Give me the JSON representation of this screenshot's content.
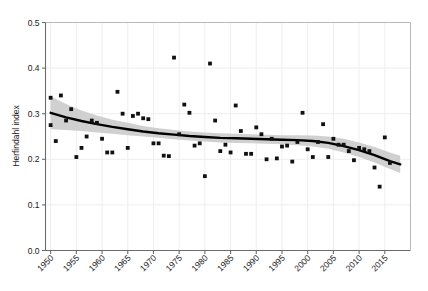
{
  "chart_data": {
    "type": "scatter",
    "title": "",
    "xlabel": "",
    "ylabel": "Herfindahl index",
    "xlim": [
      1949,
      2020
    ],
    "ylim": [
      0.0,
      0.5
    ],
    "grid": true,
    "legend": "none",
    "yticks": [
      "0.0",
      "0.1",
      "0.2",
      "0.3",
      "0.4",
      "0.5"
    ],
    "ytick_values": [
      0.0,
      0.1,
      0.2,
      0.3,
      0.4,
      0.5
    ],
    "xticks": [
      "1950",
      "1955",
      "1960",
      "1965",
      "1970",
      "1975",
      "1980",
      "1985",
      "1990",
      "1995",
      "2000",
      "2005",
      "2010",
      "2015"
    ],
    "xtick_values": [
      1950,
      1955,
      1960,
      1965,
      1970,
      1975,
      1980,
      1985,
      1990,
      1995,
      2000,
      2005,
      2010,
      2015
    ],
    "series": [
      {
        "name": "Herfindahl index observations",
        "type": "scatter",
        "marker": "square",
        "color": "#111111",
        "x": [
          1950,
          1950,
          1951,
          1952,
          1953,
          1954,
          1955,
          1956,
          1957,
          1958,
          1959,
          1960,
          1961,
          1962,
          1963,
          1964,
          1965,
          1966,
          1967,
          1968,
          1969,
          1970,
          1971,
          1972,
          1973,
          1974,
          1975,
          1976,
          1977,
          1978,
          1979,
          1980,
          1981,
          1982,
          1983,
          1984,
          1985,
          1986,
          1987,
          1988,
          1989,
          1990,
          1991,
          1992,
          1993,
          1994,
          1995,
          1996,
          1997,
          1998,
          1999,
          2000,
          2001,
          2002,
          2003,
          2004,
          2005,
          2006,
          2007,
          2008,
          2009,
          2010,
          2011,
          2012,
          2013,
          2014,
          2015,
          2016
        ],
        "y": [
          0.335,
          0.275,
          0.24,
          0.34,
          0.285,
          0.31,
          0.205,
          0.225,
          0.25,
          0.285,
          0.28,
          0.245,
          0.215,
          0.215,
          0.348,
          0.3,
          0.225,
          0.295,
          0.3,
          0.29,
          0.288,
          0.235,
          0.235,
          0.208,
          0.207,
          0.423,
          0.255,
          0.32,
          0.302,
          0.23,
          0.235,
          0.163,
          0.41,
          0.285,
          0.218,
          0.232,
          0.215,
          0.318,
          0.262,
          0.212,
          0.212,
          0.27,
          0.255,
          0.2,
          0.245,
          0.202,
          0.228,
          0.23,
          0.195,
          0.238,
          0.302,
          0.222,
          0.205,
          0.238,
          0.277,
          0.205,
          0.245,
          0.232,
          0.232,
          0.218,
          0.198,
          0.225,
          0.222,
          0.218,
          0.182,
          0.14,
          0.248,
          0.192
        ]
      },
      {
        "name": "LOESS smoothed trend",
        "type": "line",
        "color": "#000000",
        "x": [
          1950,
          1953,
          1956,
          1959,
          1962,
          1965,
          1968,
          1971,
          1974,
          1977,
          1980,
          1983,
          1986,
          1989,
          1992,
          1995,
          1998,
          2001,
          2004,
          2007,
          2010,
          2013,
          2016,
          2018
        ],
        "y": [
          0.302,
          0.292,
          0.284,
          0.277,
          0.271,
          0.266,
          0.261,
          0.257,
          0.254,
          0.251,
          0.249,
          0.247,
          0.246,
          0.245,
          0.244,
          0.243,
          0.242,
          0.24,
          0.236,
          0.229,
          0.22,
          0.209,
          0.196,
          0.189
        ]
      },
      {
        "name": "confidence band",
        "type": "band",
        "color": "#c8c8c8",
        "x": [
          1950,
          1953,
          1956,
          1959,
          1962,
          1965,
          1968,
          1971,
          1974,
          1977,
          1980,
          1983,
          1986,
          1989,
          1992,
          1995,
          1998,
          2001,
          2004,
          2007,
          2010,
          2013,
          2016,
          2018
        ],
        "lower": [
          0.266,
          0.264,
          0.262,
          0.259,
          0.256,
          0.253,
          0.25,
          0.247,
          0.244,
          0.241,
          0.239,
          0.237,
          0.236,
          0.235,
          0.234,
          0.233,
          0.231,
          0.228,
          0.223,
          0.215,
          0.205,
          0.193,
          0.179,
          0.17
        ],
        "upper": [
          0.338,
          0.321,
          0.307,
          0.296,
          0.287,
          0.28,
          0.273,
          0.268,
          0.264,
          0.261,
          0.259,
          0.257,
          0.256,
          0.255,
          0.254,
          0.253,
          0.253,
          0.252,
          0.25,
          0.245,
          0.237,
          0.227,
          0.215,
          0.208
        ]
      }
    ]
  }
}
